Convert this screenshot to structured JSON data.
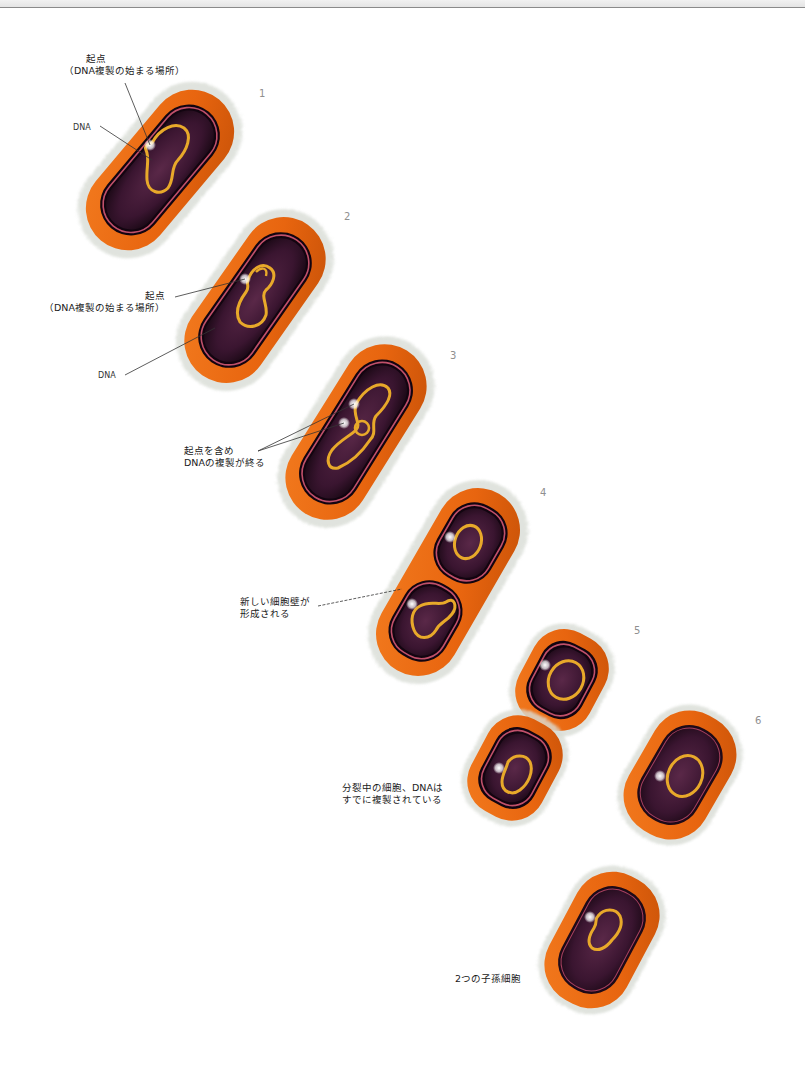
{
  "diagram": {
    "title": "",
    "colors": {
      "cell_wall": "#e8650f",
      "cell_wall_dark": "#b84808",
      "membrane": "#c0506a",
      "cytoplasm": "#3a1530",
      "dna": "#e8a92a",
      "halo": "#d9ddd6",
      "origin": "#ffffff"
    },
    "steps": [
      {
        "number": "1",
        "labels": {
          "origin": "起点",
          "origin_note": "（DNA複製の始まる場所）",
          "dna": "DNA"
        }
      },
      {
        "number": "2",
        "labels": {
          "origin": "起点",
          "origin_note": "（DNA複製の始まる場所）",
          "dna": "DNA"
        }
      },
      {
        "number": "3",
        "labels": {
          "line1": "起点を含め",
          "line2": "DNAの複製が終る"
        }
      },
      {
        "number": "4",
        "labels": {
          "line1": "新しい細胞壁が",
          "line2": "形成される"
        }
      },
      {
        "number": "5",
        "labels": {
          "line1": "分裂中の細胞、DNAは",
          "line2": "すでに複製されている"
        }
      },
      {
        "number": "6",
        "labels": {
          "line1": "2つの子孫細胞"
        }
      }
    ]
  }
}
